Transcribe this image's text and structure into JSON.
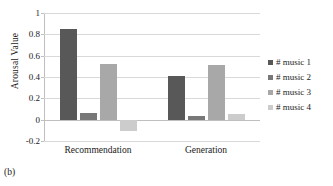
{
  "figure": {
    "caption": "(b)",
    "title_cropped": ""
  },
  "chart_data": {
    "type": "bar",
    "title": "",
    "xlabel": "",
    "ylabel": "Arousal Value",
    "categories": [
      "Recommendation",
      "Generation"
    ],
    "series": [
      {
        "name": "# music 1",
        "values": [
          0.85,
          0.41
        ],
        "color": "#585858"
      },
      {
        "name": "# music 2",
        "values": [
          0.06,
          0.035
        ],
        "color": "#787878"
      },
      {
        "name": "# music 3",
        "values": [
          0.52,
          0.515
        ],
        "color": "#a8a8a8"
      },
      {
        "name": "# music 4",
        "values": [
          -0.11,
          0.055
        ],
        "color": "#cccccc"
      }
    ],
    "ylim": [
      -0.2,
      1
    ],
    "yticks": [
      1,
      0.8,
      0.6,
      0.4,
      0.2,
      0,
      -0.2
    ],
    "ytick_labels": [
      "1",
      "0.8",
      "0.6",
      "0.4",
      "0.2",
      "0",
      "-0.2"
    ],
    "grid": true,
    "grid_axis": "y",
    "legend_position": "right",
    "zero_line": 0
  }
}
